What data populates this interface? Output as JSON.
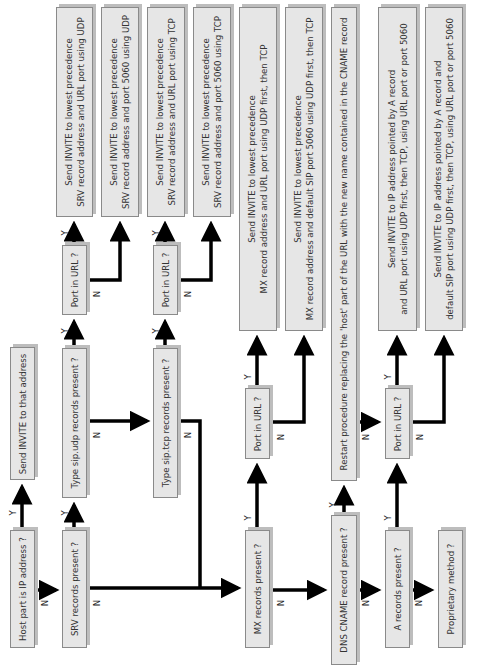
{
  "diagram": {
    "orientation": "rotated-90-ccw",
    "yes_label": "Y",
    "no_label": "N",
    "decisions": {
      "host_is_ip": "Host part is IP address ?",
      "srv_present": "SRV records present ?",
      "sip_udp_present": "Type sip.udp records present ?",
      "sip_tcp_present": "Type sip.tcp records present ?",
      "udp_port_in_url": "Port in URL ?",
      "tcp_port_in_url": "Port in URL ?",
      "mx_present": "MX records present ?",
      "mx_port_in_url": "Port in URL ?",
      "cname_present": "DNS CNAME record present ?",
      "a_present": "A records present ?",
      "a_port_in_url": "Port in URL ?",
      "proprietary": "Proprietary method ?"
    },
    "actions": {
      "send_to_ip": [
        "Send INVITE to that address"
      ],
      "srv_udp_url_port": [
        "Send INVITE to lowest precedence",
        "SRV record address and URL port using UDP"
      ],
      "srv_udp_5060": [
        "Send INVITE to lowest precedence",
        "SRV record address and port 5060 using UDP"
      ],
      "srv_tcp_url_port": [
        "Send INVITE to lowest precedence",
        "SRV record address and URL port using TCP"
      ],
      "srv_tcp_5060": [
        "Send INVITE to lowest precedence",
        "SRV record address and port 5060 using TCP"
      ],
      "mx_url_port": [
        "Send INVITE to lowest precedence",
        "MX record address and URL port using UDP first, then TCP"
      ],
      "mx_5060": [
        "Send INVITE to lowest precedence",
        "MX record address and default SIP port 5060 using UDP first, then TCP"
      ],
      "cname_restart": [
        "Restart procedure replacing the 'host' part of the URL with the new name contained in the CNAME record"
      ],
      "a_url_port": [
        "Send INVITE to IP address pointed by A record",
        "and URL port using UDP first, then TCP, using URL port or port 5060"
      ],
      "a_5060": [
        "Send INVITE to IP address pointed by A record and",
        "default SIP port using UDP first, then TCP, using URL port or port 5060"
      ]
    },
    "colors": {
      "box_fill": "#e6e6e6",
      "box_border": "#8a8a8a",
      "shadow": "#bdbdbd",
      "arrow": "#000000",
      "text": "#333333"
    }
  }
}
